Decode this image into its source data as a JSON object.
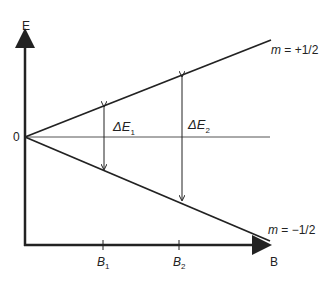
{
  "diagram": {
    "type": "zeeman-splitting",
    "y_axis_label": "E",
    "x_axis_label": "B",
    "origin_label": "0",
    "lines": [
      {
        "label": "m = +1/2",
        "m_text": "m",
        "value_text": " = +1/2",
        "direction": "up"
      },
      {
        "label": "m = −1/2",
        "m_text": "m",
        "value_text": " = −1/2",
        "direction": "down"
      }
    ],
    "ticks": [
      {
        "label": "B",
        "sub": "1"
      },
      {
        "label": "B",
        "sub": "2"
      }
    ],
    "gaps": [
      {
        "label": "ΔE",
        "sub": "1"
      },
      {
        "label": "ΔE",
        "sub": "2"
      }
    ],
    "colors": {
      "line": "#222222",
      "baseline": "#555555"
    }
  }
}
